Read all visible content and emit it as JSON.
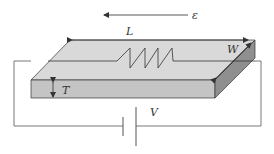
{
  "diagram": {
    "title": "",
    "labels": {
      "strain": "ε",
      "length": "L",
      "width": "W",
      "thickness": "T",
      "voltage": "V"
    },
    "colors": {
      "top_face": "#d9d9d9",
      "front_face": "#c4c4c4",
      "side_face": "#8f8f8f",
      "lines": "#333333",
      "wire": "#555555"
    },
    "components": [
      {
        "id": "slab",
        "type": "rectangular-block",
        "dims": [
          "L",
          "W",
          "T"
        ]
      },
      {
        "id": "resistor",
        "type": "zigzag-resistor",
        "on": "top_face"
      },
      {
        "id": "battery",
        "type": "dc-source",
        "label": "V"
      },
      {
        "id": "strain-arrow",
        "type": "arrow",
        "direction": "left",
        "label": "ε"
      }
    ]
  }
}
